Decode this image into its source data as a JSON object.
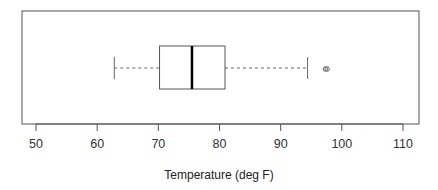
{
  "chart_data": {
    "type": "boxplot",
    "orientation": "horizontal",
    "title": "",
    "xlabel": "Temperature (deg F)",
    "ylabel": "",
    "xlim": [
      48,
      112
    ],
    "xticks": [
      50,
      60,
      70,
      80,
      90,
      100,
      110
    ],
    "tick_labels": [
      "50",
      "60",
      "70",
      "80",
      "90",
      "100",
      "110"
    ],
    "grid": false,
    "legend": null,
    "box": {
      "whisker_low": 62.8,
      "q1": 70.2,
      "median": 75.5,
      "q3": 80.9,
      "whisker_high": 94.4,
      "outliers": [
        97.3,
        97.6
      ]
    },
    "colors": {
      "box_line": "#555555",
      "median_line": "#000000",
      "whisker": "#666666",
      "frame": "#555555",
      "outlier": "#555555"
    }
  }
}
